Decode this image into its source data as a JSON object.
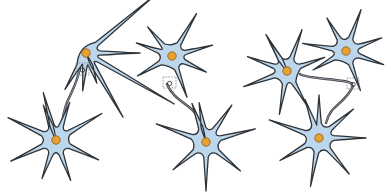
{
  "figure": {
    "colors": {
      "soma_fill": "#bcd6ec",
      "outline": "#2e3338",
      "nucleus_fill": "#e8a030",
      "axon": "#3a3f44",
      "synapse_box": "#7a7f86",
      "background": "#ffffff"
    },
    "panels": [
      {
        "id": "panel-1",
        "neurons": [
          {
            "id": "top",
            "cx": 86,
            "cy": 53,
            "r": 14,
            "spikes": [
              [
                70,
                18
              ],
              [
                120,
                28
              ],
              [
                30,
                88
              ],
              [
                0,
                40
              ],
              [
                -40,
                78
              ],
              [
                60,
                60
              ],
              [
                95,
                24
              ]
            ]
          },
          {
            "id": "bottom",
            "cx": 56,
            "cy": 140,
            "r": 15,
            "spikes": [
              [
                -70,
                25
              ],
              [
                -30,
                38
              ],
              [
                25,
                32
              ],
              [
                70,
                28
              ],
              [
                110,
                26
              ],
              [
                155,
                35
              ],
              [
                205,
                38
              ],
              [
                255,
                34
              ],
              [
                -110,
                22
              ]
            ]
          }
        ],
        "axon": {
          "from": [
            80,
            68
          ],
          "to": [
            62,
            124
          ]
        },
        "synapse_box": {
          "x": 76,
          "y": 63,
          "w": 13,
          "h": 12
        }
      },
      {
        "id": "panel-2",
        "neurons": [
          {
            "id": "top",
            "cx": 172,
            "cy": 56,
            "r": 14,
            "spikes": [
              [
                -60,
                35
              ],
              [
                -15,
                28
              ],
              [
                25,
                24
              ],
              [
                70,
                30
              ],
              [
                150,
                26
              ],
              [
                200,
                24
              ],
              [
                -130,
                24
              ]
            ]
          },
          {
            "id": "bottom",
            "cx": 206,
            "cy": 142,
            "r": 15,
            "spikes": [
              [
                -100,
                25
              ],
              [
                -55,
                30
              ],
              [
                -15,
                36
              ],
              [
                40,
                30
              ],
              [
                90,
                34
              ],
              [
                140,
                28
              ],
              [
                200,
                38
              ],
              [
                250,
                26
              ]
            ]
          }
        ],
        "axon": {
          "from": [
            167,
            84
          ],
          "to": [
            200,
            124
          ]
        },
        "synapse_box": {
          "x": 163,
          "y": 77,
          "w": 13,
          "h": 11
        }
      },
      {
        "id": "panel-3",
        "neurons": [
          {
            "id": "left",
            "cx": 287,
            "cy": 71,
            "r": 14,
            "spikes": [
              [
                -120,
                28
              ],
              [
                -70,
                30
              ],
              [
                -20,
                26
              ],
              [
                60,
                26
              ],
              [
                100,
                30
              ],
              [
                160,
                32
              ],
              [
                200,
                28
              ],
              [
                240,
                22
              ]
            ]
          },
          {
            "id": "right-top",
            "cx": 346,
            "cy": 51,
            "r": 14,
            "spikes": [
              [
                -70,
                30
              ],
              [
                -20,
                24
              ],
              [
                20,
                26
              ],
              [
                70,
                28
              ],
              [
                150,
                24
              ],
              [
                190,
                30
              ],
              [
                -120,
                24
              ]
            ]
          },
          {
            "id": "bottom",
            "cx": 319,
            "cy": 138,
            "r": 15,
            "spikes": [
              [
                -90,
                28
              ],
              [
                -40,
                30
              ],
              [
                0,
                32
              ],
              [
                50,
                32
              ],
              [
                100,
                34
              ],
              [
                150,
                30
              ],
              [
                200,
                38
              ],
              [
                250,
                26
              ]
            ]
          }
        ],
        "axons": [
          {
            "from": [
              300,
              74
            ],
            "to": [
              352,
              84
            ]
          },
          {
            "from": [
              353,
              86
            ],
            "to": [
              326,
              123
            ]
          }
        ],
        "synapse_box": {
          "x": 347,
          "y": 78,
          "w": 12,
          "h": 11
        }
      }
    ]
  }
}
